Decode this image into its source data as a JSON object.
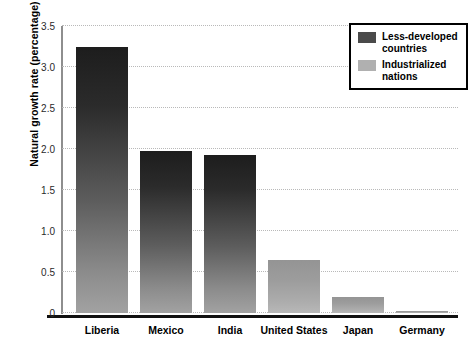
{
  "chart_data": {
    "type": "bar",
    "title": "",
    "xlabel": "",
    "ylabel": "Natural growth rate (percentage)",
    "categories": [
      "Liberia",
      "Mexico",
      "India",
      "United\nStates",
      "Japan",
      "Germany"
    ],
    "values": [
      3.25,
      1.97,
      1.93,
      0.65,
      0.19,
      0.03
    ],
    "groups": [
      "less-developed",
      "less-developed",
      "less-developed",
      "industrialized",
      "industrialized",
      "industrialized"
    ],
    "ylim": [
      0,
      3.5
    ],
    "ytick_values": [
      0,
      0.5,
      1.0,
      1.5,
      2.0,
      2.5,
      3.0,
      3.5
    ],
    "ytick_labels": [
      "0",
      "0.5",
      "1.0",
      "1.5",
      "2.0",
      "2.5",
      "3.0",
      "3.5"
    ],
    "grid": true,
    "legend_position": "top-right",
    "legend": [
      {
        "label": "Less-developed\ncountries",
        "color": "#4a4a4a"
      },
      {
        "label": "Industrialized\nnations",
        "color": "#b0b0b0"
      }
    ],
    "colors": {
      "bar_dark_top": "#1d1d1d",
      "bar_dark_bottom": "#a2a2a2",
      "bar_light_top": "#949494",
      "bar_light_bottom": "#b8b8b8",
      "axis": "#8e8e8e",
      "baseline": "#111111",
      "gridline": "#b9b9b9",
      "text": "#000000",
      "background": "#ffffff"
    }
  }
}
